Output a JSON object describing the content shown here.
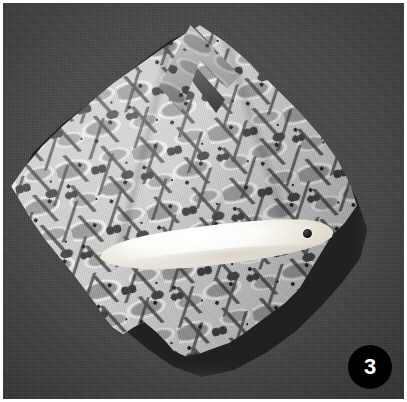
{
  "figure": {
    "number_label": "3",
    "caption": "",
    "background_color": "#434343",
    "badge_color": "#000000",
    "badge_text_color": "#ffffff",
    "frame_color": "#ffffff"
  },
  "photo": {
    "backdrop_name": "dark gray textured backdrop",
    "cloth_name": "folded printed cloth",
    "cloth_pattern_name": "tessellating-bird-pattern",
    "cloth_base_color": "#cfcfcf",
    "cloth_motif_color": "#9a9a9a",
    "cloth_dark_color": "#343434",
    "implement_name": "white bone implement",
    "implement_color": "#fbfbf8",
    "implement_hole_name": "drilled hole",
    "flap_name": "folded corner flap",
    "shadow_name": "cast shadow"
  }
}
